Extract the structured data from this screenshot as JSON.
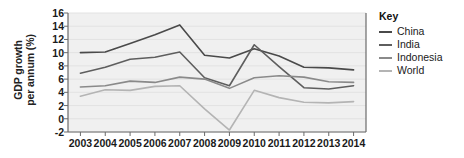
{
  "chart_data": {
    "type": "line",
    "title": "",
    "xlabel": "",
    "ylabel": "GDP growth per annum (%)",
    "ylabel_line1": "GDP growth",
    "ylabel_line2": "per annum (%)",
    "categories": [
      "2003",
      "2004",
      "2005",
      "2006",
      "2007",
      "2008",
      "2009",
      "2010",
      "2011",
      "2012",
      "2013",
      "2014"
    ],
    "x": [
      2003,
      2004,
      2005,
      2006,
      2007,
      2008,
      2009,
      2010,
      2011,
      2012,
      2013,
      2014
    ],
    "ylim": [
      -2,
      16
    ],
    "yticks": [
      -2,
      0,
      2,
      4,
      6,
      8,
      10,
      12,
      14,
      16
    ],
    "grid": true,
    "legend_position": "right",
    "legend_title": "Key",
    "series": [
      {
        "name": "China",
        "color": "#4a4a4a",
        "values": [
          10.0,
          10.1,
          11.4,
          12.7,
          14.2,
          9.6,
          9.2,
          10.6,
          9.5,
          7.8,
          7.7,
          7.4
        ]
      },
      {
        "name": "India",
        "color": "#5e5e5e",
        "values": [
          6.9,
          7.8,
          9.0,
          9.3,
          10.1,
          6.2,
          5.0,
          11.2,
          7.9,
          4.7,
          4.5,
          5.0
        ]
      },
      {
        "name": "Indonesia",
        "color": "#8a8a8a",
        "values": [
          4.8,
          5.0,
          5.7,
          5.5,
          6.3,
          6.0,
          4.6,
          6.2,
          6.5,
          6.3,
          5.6,
          5.5
        ]
      },
      {
        "name": "World",
        "color": "#b4b4b4",
        "values": [
          3.4,
          4.4,
          4.3,
          4.9,
          5.0,
          1.5,
          -1.7,
          4.3,
          3.2,
          2.5,
          2.4,
          2.6
        ]
      }
    ]
  },
  "legend": {
    "title": "Key",
    "entries": [
      {
        "label": "China",
        "color": "#4a4a4a"
      },
      {
        "label": "India",
        "color": "#5e5e5e"
      },
      {
        "label": "Indonesia",
        "color": "#8a8a8a"
      },
      {
        "label": "World",
        "color": "#b4b4b4"
      }
    ]
  },
  "plot": {
    "background": "#f0f0f0",
    "border_color": "#6b6b6b",
    "gridline_color": "#e2e2e2"
  }
}
